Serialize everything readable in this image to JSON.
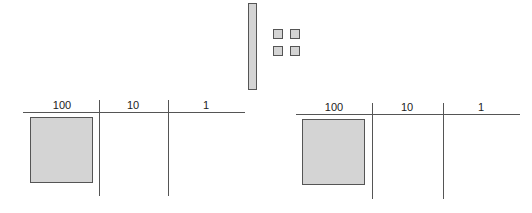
{
  "models": {
    "rod": {
      "label": "ten rod",
      "count": 1
    },
    "units": {
      "label": "unit cubes",
      "count": 4
    }
  },
  "place_value_charts": [
    {
      "headers": [
        "100",
        "10",
        "1"
      ],
      "contents": {
        "hundreds": 1,
        "tens": 0,
        "ones": 0
      }
    },
    {
      "headers": [
        "100",
        "10",
        "1"
      ],
      "contents": {
        "hundreds": 1,
        "tens": 0,
        "ones": 0
      }
    }
  ],
  "colors": {
    "fill": "#d4d4d4",
    "stroke": "#555555"
  }
}
